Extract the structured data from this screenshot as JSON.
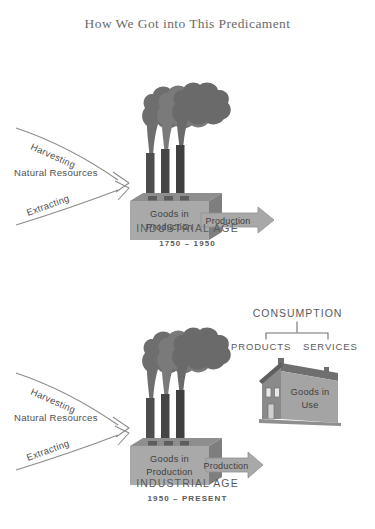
{
  "title": "How We Got into This Predicament",
  "colors": {
    "background": "#ffffff",
    "text": "#5a5a5a",
    "box_front": "#a9a9a9",
    "box_top": "#8e8e8e",
    "box_side": "#7e7e7e",
    "stack": "#4d4d4d",
    "smoke": "#6e6e6e",
    "arrow_fill": "#a8a8a8",
    "arrow_stroke": "#8a8a8a",
    "outline_arrow": "#8c8c8c",
    "house_front": "#a4a4a4",
    "house_gable": "#8a8a8a",
    "house_roof": "#7a7a7a"
  },
  "diagrams": [
    {
      "id": "industrial-age-early",
      "inputs": {
        "upper_curve_label": "Harvesting",
        "center_label": "Natural Resources",
        "lower_curve_label": "Extracting"
      },
      "factory": {
        "label_line1": "Goods in",
        "label_line2": "Production",
        "smokestack_count": 3
      },
      "output_arrow": "Production",
      "has_house": false,
      "era": {
        "name": "INDUSTRIAL AGE",
        "years": "1750 – 1950"
      }
    },
    {
      "id": "industrial-age-modern",
      "inputs": {
        "upper_curve_label": "Harvesting",
        "center_label": "Natural Resources",
        "lower_curve_label": "Extracting"
      },
      "factory": {
        "label_line1": "Goods in",
        "label_line2": "Production",
        "smokestack_count": 3
      },
      "output_arrow": "Production",
      "has_house": true,
      "house": {
        "label_line1": "Goods in",
        "label_line2": "Use"
      },
      "consumption": {
        "title": "CONSUMPTION",
        "branches": [
          "PRODUCTS",
          "SERVICES"
        ]
      },
      "era": {
        "name": "INDUSTRIAL AGE",
        "years": "1950 – PRESENT"
      }
    }
  ]
}
